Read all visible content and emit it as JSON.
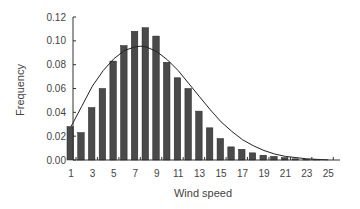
{
  "chart_data": {
    "type": "bar",
    "title": "",
    "xlabel": "Wind speed",
    "ylabel": "Frequency",
    "ylim": [
      0,
      0.12
    ],
    "xlim": [
      1,
      25
    ],
    "yticks": [
      "0.00",
      "0.02",
      "0.04",
      "0.06",
      "0.08",
      "0.10",
      "0.12"
    ],
    "xticks": [
      "1",
      "3",
      "5",
      "7",
      "9",
      "11",
      "13",
      "15",
      "17",
      "19",
      "21",
      "23",
      "25"
    ],
    "grid": false,
    "legend": null,
    "categories": [
      1,
      2,
      3,
      4,
      5,
      6,
      7,
      8,
      9,
      10,
      11,
      12,
      13,
      14,
      15,
      16,
      17,
      18,
      19,
      20,
      21,
      22,
      23,
      24
    ],
    "series": [
      {
        "name": "Observed frequency",
        "type": "bar",
        "values": [
          0.028,
          0.023,
          0.044,
          0.06,
          0.083,
          0.096,
          0.108,
          0.111,
          0.104,
          0.082,
          0.069,
          0.06,
          0.041,
          0.027,
          0.018,
          0.011,
          0.009,
          0.006,
          0.004,
          0.003,
          0.002,
          0.001,
          0.0005,
          0.0003
        ]
      },
      {
        "name": "Fitted distribution",
        "type": "line",
        "x": [
          1,
          2,
          3,
          4,
          5,
          6,
          7,
          7.5,
          8,
          9,
          10,
          11,
          12,
          13,
          14,
          15,
          16,
          17,
          18,
          19,
          20,
          21,
          22,
          23,
          24,
          25
        ],
        "values": [
          0.028,
          0.045,
          0.062,
          0.075,
          0.085,
          0.092,
          0.095,
          0.0955,
          0.095,
          0.091,
          0.084,
          0.075,
          0.064,
          0.053,
          0.042,
          0.032,
          0.024,
          0.017,
          0.012,
          0.008,
          0.005,
          0.003,
          0.002,
          0.001,
          0.0005,
          0.0002
        ]
      }
    ]
  },
  "colors": {
    "bar": "#4a4a4a",
    "line": "#222222",
    "axis": "#333333",
    "text": "#444444"
  }
}
